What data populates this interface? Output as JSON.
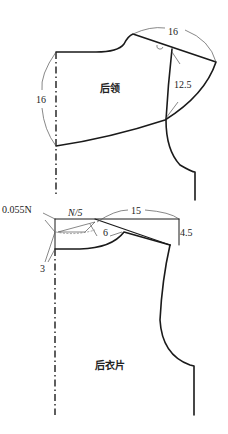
{
  "diagram": {
    "collar_piece": {
      "label": "后领",
      "dimensions": {
        "center_back_length": "16",
        "shoulder_span": "16",
        "armhole_depth": "12.5"
      }
    },
    "back_body_piece": {
      "label": "后衣片",
      "dimensions": {
        "neck_offset": "0.055N",
        "neck_width": "N/5",
        "shoulder_length": "15",
        "shoulder_drop": "4.5",
        "neck_curve": "6",
        "back_neck_depth": "3"
      }
    },
    "colors": {
      "outline": "#1a1a1a",
      "guide": "#555555",
      "background": "#ffffff"
    }
  }
}
